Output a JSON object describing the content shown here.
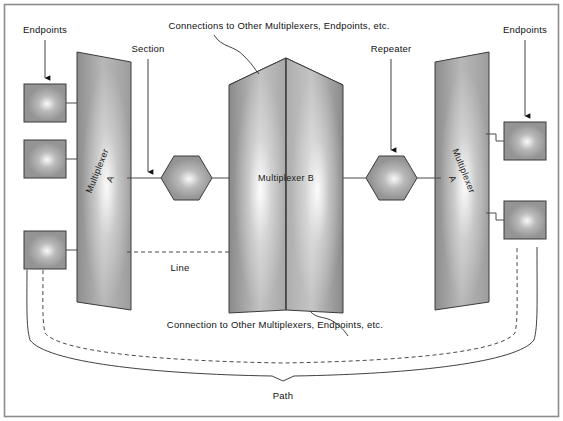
{
  "figure": {
    "frame_color": "#8c8c8c",
    "background": "#ffffff",
    "shape_fill": "#9a9a9a",
    "shape_stroke": "#3a3a3a",
    "line_color": "#4a4a4a"
  },
  "labels": {
    "endpoints_left": "Endpoints",
    "endpoints_right": "Endpoints",
    "section": "Section",
    "repeater": "Repeater",
    "line": "Line",
    "path": "Path",
    "connections_top": "Connections to Other Multiplexers, Endpoints, etc.",
    "connection_bottom": "Connection to Other Multiplexers, Endpoints, etc."
  },
  "nodes": {
    "mux_left": {
      "line1": "Multiplexer",
      "line2": "A"
    },
    "mux_center": {
      "label": "Multiplexer B"
    },
    "mux_right": {
      "line1": "Multiplexer",
      "line2": "A"
    },
    "repeater_left": {
      "label": ""
    },
    "repeater_right": {
      "label": ""
    }
  },
  "endpoints": {
    "left": [
      {
        "name": "endpoint-left-1"
      },
      {
        "name": "endpoint-left-2"
      },
      {
        "name": "endpoint-left-3"
      }
    ],
    "right": [
      {
        "name": "endpoint-right-1"
      },
      {
        "name": "endpoint-right-2"
      }
    ]
  }
}
